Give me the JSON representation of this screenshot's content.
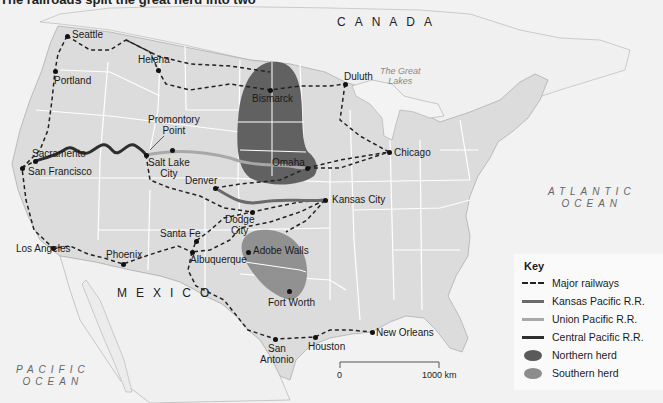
{
  "caption": "The railroads split the great herd into two",
  "countries": [
    {
      "name": "CANADA",
      "x": 337,
      "y": 15
    },
    {
      "name": "MEXICO",
      "x": 117,
      "y": 286
    }
  ],
  "oceans": [
    {
      "name": "ATLANTIC\nOCEAN",
      "line1": "ATLANTIC",
      "line2": "OCEAN",
      "x": 548,
      "y": 186
    },
    {
      "name": "PACIFIC\nOCEAN",
      "line1": "PACIFIC",
      "line2": "OCEAN",
      "x": 16,
      "y": 364
    }
  ],
  "lakes_label": {
    "line1": "The Great",
    "line2": "Lakes"
  },
  "cities": [
    {
      "name": "Seattle",
      "dot": [
        67,
        36
      ],
      "x": 72,
      "y": 29
    },
    {
      "name": "Portland",
      "dot": [
        55,
        71
      ],
      "x": 54,
      "y": 75
    },
    {
      "name": "Helena",
      "dot": [
        158,
        70
      ],
      "x": 138,
      "y": 54
    },
    {
      "name": "Bismarck",
      "dot": [
        270,
        90
      ],
      "x": 252,
      "y": 93
    },
    {
      "name": "Duluth",
      "dot": [
        345,
        84
      ],
      "x": 344,
      "y": 71
    },
    {
      "name": "Promontory",
      "line2": "Point",
      "dot": [
        172,
        150
      ],
      "x": 148,
      "y": 114
    },
    {
      "name": "Sacramento",
      "dot": [
        35,
        161
      ],
      "x": 32,
      "y": 148
    },
    {
      "name": "San Francisco",
      "dot": [
        22,
        168
      ],
      "x": 28,
      "y": 166
    },
    {
      "name": "Salt Lake",
      "line2": "City",
      "dot": [
        146,
        155
      ],
      "x": 148,
      "y": 157
    },
    {
      "name": "Omaha",
      "dot": [
        307,
        168
      ],
      "x": 272,
      "y": 157
    },
    {
      "name": "Chicago",
      "dot": [
        389,
        152
      ],
      "x": 394,
      "y": 147
    },
    {
      "name": "Denver",
      "dot": [
        215,
        188
      ],
      "x": 185,
      "y": 175
    },
    {
      "name": "Kansas City",
      "dot": [
        325,
        200
      ],
      "x": 332,
      "y": 194
    },
    {
      "name": "Dodge",
      "line2": "City",
      "dot": [
        252,
        212
      ],
      "x": 225,
      "y": 214
    },
    {
      "name": "Santa Fe",
      "dot": [
        196,
        241
      ],
      "x": 160,
      "y": 228
    },
    {
      "name": "Los Angeles",
      "dot": [
        53,
        248
      ],
      "x": 16,
      "y": 243
    },
    {
      "name": "Phoenix",
      "dot": [
        123,
        264
      ],
      "x": 106,
      "y": 249
    },
    {
      "name": "Albuquerque",
      "dot": [
        192,
        252
      ],
      "x": 190,
      "y": 254
    },
    {
      "name": "Adobe Walls",
      "dot": [
        248,
        252
      ],
      "x": 253,
      "y": 245
    },
    {
      "name": "Fort Worth",
      "dot": [
        289,
        291
      ],
      "x": 268,
      "y": 297
    },
    {
      "name": "San",
      "line2": "Antonio",
      "dot": [
        275,
        339
      ],
      "x": 260,
      "y": 343
    },
    {
      "name": "Houston",
      "dot": [
        315,
        337
      ],
      "x": 308,
      "y": 341
    },
    {
      "name": "New Orleans",
      "dot": [
        372,
        332
      ],
      "x": 376,
      "y": 327
    }
  ],
  "key": {
    "title": "Key",
    "items": [
      {
        "label": "Major railways",
        "symbol": "dashed-line",
        "color": "#222222"
      },
      {
        "label": "Kansas Pacific R.R.",
        "symbol": "line",
        "color": "#6a6a6a"
      },
      {
        "label": "Union Pacific R.R.",
        "symbol": "line",
        "color": "#a8a8a8"
      },
      {
        "label": "Central Pacific R.R.",
        "symbol": "line",
        "color": "#2e2e2e"
      },
      {
        "label": "Northern herd",
        "symbol": "blob",
        "color": "#5a5a5a"
      },
      {
        "label": "Southern herd",
        "symbol": "blob",
        "color": "#8c8c8c"
      }
    ]
  },
  "scale": {
    "start_label": "0",
    "end_label": "1000 km"
  },
  "colors": {
    "land_us": "#dcdcdc",
    "land_other": "#f0f0f0",
    "water": "#f6f6f6",
    "northern_herd": "#5a5a5a",
    "southern_herd": "#8c8c8c",
    "kansas_pacific": "#6a6a6a",
    "union_pacific": "#a8a8a8",
    "central_pacific": "#2e2e2e"
  }
}
